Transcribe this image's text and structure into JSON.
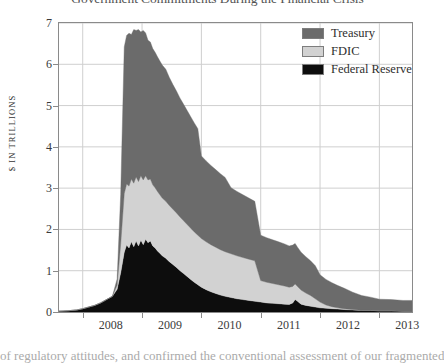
{
  "chart_title": "Government Commitments During the Financial Crisis",
  "caption": "of regulatory attitudes, and confirmed the conventional assessment of our fragmented",
  "axes": {
    "y_axis_title": "$ IN TRILLIONS",
    "y_ticks": [
      "0",
      "1",
      "2",
      "3",
      "4",
      "5",
      "6",
      "7"
    ],
    "x_ticks": [
      "2008",
      "2009",
      "2010",
      "2011",
      "2012",
      "2013"
    ]
  },
  "legend": {
    "position": "top-right",
    "items": [
      {
        "label": "Treasury",
        "color": "#6b6b6b"
      },
      {
        "label": "FDIC",
        "color": "#d2d2d2"
      },
      {
        "label": "Federal Reserve",
        "color": "#0d0d0d"
      }
    ]
  },
  "chart_data": {
    "type": "area",
    "stacked": true,
    "title": "Government Commitments During the Financial Crisis",
    "xlabel": "",
    "ylabel": "$ IN TRILLIONS",
    "ylim": [
      0,
      7
    ],
    "xlim": [
      2007.6,
      2013.55
    ],
    "grid": true,
    "grid_axis": "both",
    "x_tick_values": [
      2008,
      2009,
      2010,
      2011,
      2012,
      2013
    ],
    "y_tick_values": [
      0,
      1,
      2,
      3,
      4,
      5,
      6,
      7
    ],
    "legend_position": "top-right",
    "x": [
      2007.6,
      2007.75,
      2007.9,
      2008.0,
      2008.1,
      2008.2,
      2008.3,
      2008.4,
      2008.5,
      2008.58,
      2008.64,
      2008.7,
      2008.74,
      2008.78,
      2008.82,
      2008.86,
      2008.9,
      2008.94,
      2008.98,
      2009.02,
      2009.06,
      2009.1,
      2009.14,
      2009.18,
      2009.22,
      2009.26,
      2009.3,
      2009.34,
      2009.4,
      2009.46,
      2009.52,
      2009.58,
      2009.64,
      2009.7,
      2009.76,
      2009.82,
      2009.88,
      2009.94,
      2010.0,
      2010.08,
      2010.16,
      2010.24,
      2010.32,
      2010.4,
      2010.5,
      2010.6,
      2010.7,
      2010.8,
      2010.9,
      2011.0,
      2011.1,
      2011.2,
      2011.3,
      2011.4,
      2011.48,
      2011.54,
      2011.58,
      2011.62,
      2011.68,
      2011.76,
      2011.84,
      2011.92,
      2012.0,
      2012.1,
      2012.2,
      2012.3,
      2012.4,
      2012.55,
      2012.7,
      2012.85,
      2013.0,
      2013.2,
      2013.4,
      2013.55
    ],
    "series": [
      {
        "name": "Federal Reserve",
        "color": "#0d0d0d",
        "values": [
          0.02,
          0.03,
          0.05,
          0.08,
          0.12,
          0.16,
          0.22,
          0.3,
          0.38,
          0.55,
          0.95,
          1.45,
          1.62,
          1.55,
          1.7,
          1.58,
          1.72,
          1.6,
          1.74,
          1.63,
          1.76,
          1.68,
          1.72,
          1.6,
          1.55,
          1.48,
          1.42,
          1.36,
          1.3,
          1.22,
          1.15,
          1.08,
          1.0,
          0.93,
          0.86,
          0.79,
          0.72,
          0.66,
          0.6,
          0.54,
          0.49,
          0.45,
          0.41,
          0.38,
          0.35,
          0.32,
          0.3,
          0.28,
          0.26,
          0.24,
          0.22,
          0.21,
          0.2,
          0.19,
          0.18,
          0.22,
          0.3,
          0.26,
          0.19,
          0.16,
          0.14,
          0.12,
          0.1,
          0.09,
          0.08,
          0.07,
          0.06,
          0.05,
          0.04,
          0.04,
          0.03,
          0.03,
          0.02,
          0.02
        ]
      },
      {
        "name": "FDIC",
        "color": "#d2d2d2",
        "values": [
          0.0,
          0.0,
          0.0,
          0.0,
          0.0,
          0.0,
          0.0,
          0.0,
          0.0,
          0.1,
          0.7,
          1.42,
          1.48,
          1.5,
          1.52,
          1.54,
          1.55,
          1.56,
          1.56,
          1.57,
          1.54,
          1.52,
          1.5,
          1.48,
          1.46,
          1.44,
          1.42,
          1.4,
          1.38,
          1.36,
          1.34,
          1.32,
          1.3,
          1.28,
          1.26,
          1.24,
          1.22,
          1.2,
          1.18,
          1.16,
          1.14,
          1.12,
          1.1,
          1.08,
          1.06,
          1.04,
          1.02,
          1.0,
          0.98,
          0.52,
          0.5,
          0.48,
          0.46,
          0.44,
          0.42,
          0.4,
          0.38,
          0.36,
          0.34,
          0.3,
          0.26,
          0.2,
          0.14,
          0.08,
          0.05,
          0.03,
          0.02,
          0.01,
          0.0,
          0.0,
          0.0,
          0.0,
          0.0,
          0.0
        ]
      },
      {
        "name": "Treasury",
        "color": "#6b6b6b",
        "values": [
          0.0,
          0.0,
          0.0,
          0.0,
          0.0,
          0.0,
          0.0,
          0.0,
          0.0,
          0.15,
          1.2,
          3.55,
          3.6,
          3.7,
          3.5,
          3.72,
          3.55,
          3.68,
          3.48,
          3.62,
          3.46,
          3.38,
          3.32,
          3.3,
          3.28,
          3.26,
          3.24,
          3.22,
          3.2,
          3.1,
          3.02,
          2.95,
          2.88,
          2.82,
          2.76,
          2.7,
          2.64,
          2.58,
          2.0,
          1.96,
          1.92,
          1.88,
          1.84,
          1.8,
          1.6,
          1.56,
          1.52,
          1.48,
          1.44,
          1.1,
          1.08,
          1.06,
          1.04,
          1.02,
          1.0,
          1.0,
          0.98,
          0.95,
          0.92,
          0.88,
          0.84,
          0.8,
          0.66,
          0.62,
          0.58,
          0.54,
          0.5,
          0.42,
          0.36,
          0.32,
          0.28,
          0.27,
          0.26,
          0.26
        ]
      }
    ]
  }
}
